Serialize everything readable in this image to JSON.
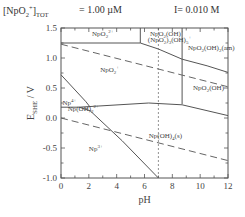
{
  "header": {
    "species_prefix": "[NpO",
    "species_sub": "2",
    "species_sup": "+",
    "species_suffix": "]",
    "species_tot_sub": "TOT",
    "concentration": "=   1.00 µM",
    "ionic_strength": "I= 0.010 M"
  },
  "chart_data": {
    "type": "line",
    "xlabel": "pH",
    "ylabel": "E_SHE / V",
    "xlim": [
      0,
      12
    ],
    "ylim": [
      -1.0,
      1.5
    ],
    "x_ticks": [
      0,
      2,
      4,
      6,
      8,
      10,
      12
    ],
    "x_tick_labels": [
      "0",
      "2",
      "4",
      "6",
      "8",
      "10",
      "12"
    ],
    "y_ticks": [
      1.5,
      1.0,
      0.5,
      0.0,
      -0.5,
      -1.0
    ],
    "y_tick_labels": [
      "1.5",
      "1.0",
      "0.5",
      "0.0",
      "-0.5",
      "-1.0"
    ],
    "grid": false,
    "legend": "none",
    "regions": [
      {
        "label": "NpO2 2+",
        "x": 3.0,
        "y": 1.37
      },
      {
        "label": "NpO2(OH)+",
        "x": 7.6,
        "y": 1.37
      },
      {
        "label": "(NpO2)3(OH)5+",
        "x": 7.8,
        "y": 1.27
      },
      {
        "label": "NpO2(OH)2(am)",
        "x": 10.8,
        "y": 1.14
      },
      {
        "label": "NpO2+",
        "x": 3.5,
        "y": 0.76
      },
      {
        "label": "NpO2(OH)",
        "x": 10.6,
        "y": 0.46
      },
      {
        "label": "Np4+",
        "x": 0.6,
        "y": 0.22
      },
      {
        "label": "NpOH2 2+",
        "x": 1.6,
        "y": 0.11
      },
      {
        "label": "Np(OH)4(s)",
        "x": 7.5,
        "y": -0.34
      },
      {
        "label": "Np3+",
        "x": 2.5,
        "y": -0.55
      }
    ],
    "series": [
      {
        "name": "NpO2 2+/NpO2+ boundary",
        "style": "solid",
        "x": [
          0,
          5.7,
          7.0,
          8.7,
          10.5,
          12
        ],
        "y": [
          1.25,
          1.25,
          1.15,
          0.98,
          0.87,
          0.76
        ]
      },
      {
        "name": "NpO2 2+/NpO2(OH)+ vertical",
        "style": "solid",
        "x": [
          5.7,
          5.7
        ],
        "y": [
          1.25,
          1.5
        ]
      },
      {
        "name": "NpO2(OH)2(am) vertical",
        "style": "solid",
        "x": [
          8.7,
          8.7
        ],
        "y": [
          0.23,
          1.5
        ]
      },
      {
        "name": "NpO2+/Np(IV) boundary",
        "style": "solid",
        "x": [
          0,
          1.3,
          6.3,
          8.7,
          12
        ],
        "y": [
          0.18,
          0.18,
          0.25,
          0.22,
          0.04
        ]
      },
      {
        "name": "Np4+/NpOH2 2+ boundary",
        "style": "solid",
        "x": [
          0,
          1.8,
          2.1
        ],
        "y": [
          0.72,
          0.27,
          0.18
        ]
      },
      {
        "name": "Np(IV)/Np3+ boundary",
        "style": "solid",
        "x": [
          1.3,
          2.1,
          4.4,
          7.0
        ],
        "y": [
          0.18,
          0.12,
          -0.38,
          -1.0
        ]
      },
      {
        "name": "O2/H2O line",
        "style": "dashed",
        "x": [
          0,
          12
        ],
        "y": [
          1.23,
          0.52
        ]
      },
      {
        "name": "H2O/H2 line",
        "style": "dashed",
        "x": [
          0,
          12
        ],
        "y": [
          0.0,
          -0.71
        ]
      },
      {
        "name": "pH 7 reference",
        "style": "dotted",
        "x": [
          7.0,
          7.0
        ],
        "y": [
          -1.0,
          1.5
        ]
      }
    ]
  }
}
